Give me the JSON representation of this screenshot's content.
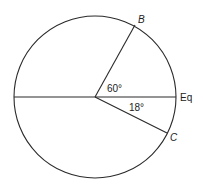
{
  "diagram": {
    "type": "circle-angle-diagram",
    "stroke_color": "#2a2a2a",
    "background": "#ffffff",
    "circle": {
      "cx": 95,
      "cy": 97,
      "r": 81
    },
    "lines": [
      {
        "name": "equator-diameter",
        "x1": 14,
        "y1": 97,
        "x2": 176,
        "y2": 97
      },
      {
        "name": "radius-to-b",
        "x1": 95,
        "y1": 97,
        "x2": 135,
        "y2": 25
      },
      {
        "name": "radius-to-c",
        "x1": 95,
        "y1": 97,
        "x2": 167,
        "y2": 133
      }
    ],
    "labels": {
      "point_b": "B",
      "point_c": "C",
      "equator": "Eq",
      "angle_b": "60°",
      "angle_c": "18°"
    }
  }
}
